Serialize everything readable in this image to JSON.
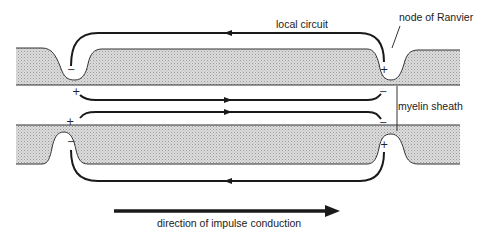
{
  "diagram": {
    "labels": {
      "local_circuit": "local circuit",
      "node_of_ranvier": "node of Ranvier",
      "myelin_sheath": "myelin sheath",
      "direction": "direction of impulse conduction"
    },
    "signs": {
      "top_left_node_inside": "−",
      "top_left_axon": "+",
      "top_right_node_inside": "+",
      "top_right_axon": "−",
      "bottom_left_axon": "+",
      "bottom_left_node_inside": "−",
      "bottom_right_axon": "−",
      "bottom_right_node_inside": "+"
    },
    "colors": {
      "sheath_fill": "#d6d6d6",
      "line": "#1a1a1a",
      "background": "#ffffff"
    }
  }
}
